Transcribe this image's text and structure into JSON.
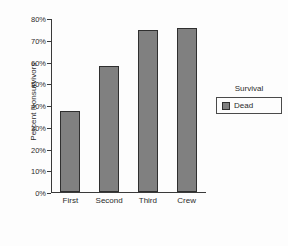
{
  "chart_data": {
    "type": "bar",
    "title": "",
    "subtitle": "",
    "categories": [
      "First",
      "Second",
      "Third",
      "Crew"
    ],
    "values": [
      37.5,
      58.3,
      74.8,
      76.0
    ],
    "series": [
      {
        "name": "Dead",
        "values": [
          37.5,
          58.3,
          74.8,
          76.0
        ],
        "color": "#808080"
      }
    ],
    "xlabel": "",
    "ylabel": "Percent Nonsurvivors",
    "ylim": [
      0,
      80
    ],
    "ytick_values": [
      0,
      10,
      20,
      30,
      40,
      50,
      60,
      70,
      80
    ],
    "ytick_labels": [
      "0%",
      "10%",
      "20%",
      "30%",
      "40%",
      "50%",
      "60%",
      "70%",
      "80%"
    ],
    "grid": false,
    "legend_position": "right",
    "legend": {
      "title": "Survival",
      "entries": [
        {
          "label": "Dead",
          "color": "#808080"
        }
      ]
    },
    "bar_fill_color": "#808080",
    "bar_edge_color": "#2f2f2f",
    "axis_color": "#3a3a3a",
    "background_color": "#fdfdfd"
  }
}
